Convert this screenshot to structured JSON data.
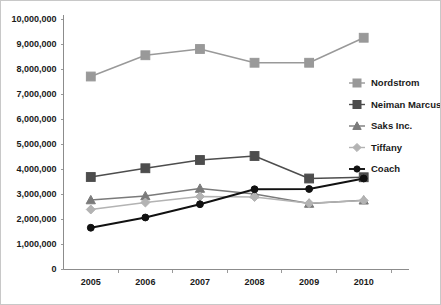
{
  "chart_data": {
    "type": "line",
    "title": "",
    "subtitle": "",
    "xlabel": "",
    "ylabel": "",
    "categories": [
      "2005",
      "2006",
      "2007",
      "2008",
      "2009",
      "2010"
    ],
    "x": [
      2005,
      2006,
      2007,
      2008,
      2009,
      2010
    ],
    "ylim": [
      0,
      10000000
    ],
    "yticks": [
      0,
      1000000,
      2000000,
      3000000,
      4000000,
      5000000,
      6000000,
      7000000,
      8000000,
      9000000,
      10000000
    ],
    "ytick_labels": [
      "0",
      "1,000,000",
      "2,000,000",
      "3,000,000",
      "4,000,000",
      "5,000,000",
      "6,000,000",
      "7,000,000",
      "8,000,000",
      "9,000,000",
      "10,000,000"
    ],
    "grid": false,
    "legend_position": "right",
    "series": [
      {
        "name": "Nordstrom",
        "color": "#999999",
        "marker": "square",
        "values": [
          7700000,
          8550000,
          8800000,
          8250000,
          8250000,
          9250000
        ]
      },
      {
        "name": "Neiman Marcus",
        "color": "#4d4d4d",
        "marker": "square",
        "values": [
          3680000,
          4030000,
          4360000,
          4520000,
          3620000,
          3670000
        ]
      },
      {
        "name": "Saks Inc.",
        "color": "#7a7a7a",
        "marker": "triangle",
        "values": [
          2760000,
          2920000,
          3220000,
          3000000,
          2620000,
          2750000
        ]
      },
      {
        "name": "Tiffany",
        "color": "#b3b3b3",
        "marker": "diamond",
        "values": [
          2380000,
          2660000,
          2900000,
          2880000,
          2630000,
          2740000
        ]
      },
      {
        "name": "Coach",
        "color": "#111111",
        "marker": "circle",
        "values": [
          1650000,
          2060000,
          2590000,
          3190000,
          3200000,
          3620000
        ]
      }
    ]
  },
  "legend": {
    "items": [
      {
        "label": "Nordstrom"
      },
      {
        "label": "Neiman Marcus"
      },
      {
        "label": "Saks Inc."
      },
      {
        "label": "Tiffany"
      },
      {
        "label": "Coach"
      }
    ]
  }
}
